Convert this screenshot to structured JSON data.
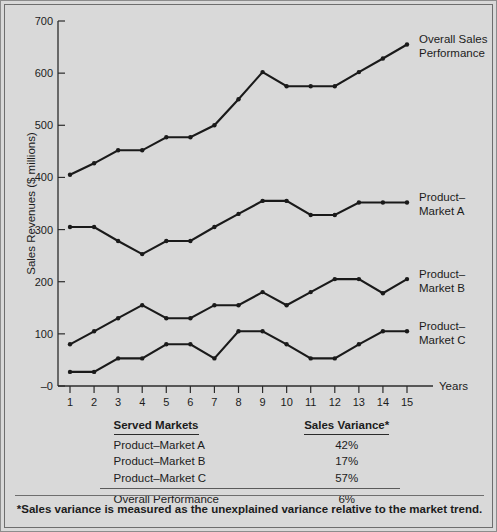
{
  "chart_data": {
    "type": "line",
    "title": "",
    "xlabel": "Years",
    "ylabel": "Sales Revenues ($ millions)",
    "x": [
      1,
      2,
      3,
      4,
      5,
      6,
      7,
      8,
      9,
      10,
      11,
      12,
      13,
      14,
      15
    ],
    "xtick_labels": [
      "1",
      "2",
      "3",
      "4",
      "5",
      "6",
      "7",
      "8",
      "9",
      "10",
      "11",
      "12",
      "13",
      "14",
      "15"
    ],
    "ytick_labels": [
      "–0",
      "100",
      "200",
      "300",
      "400",
      "500",
      "600",
      "700"
    ],
    "ytick_values": [
      0,
      100,
      200,
      300,
      400,
      500,
      600,
      700
    ],
    "ylim": [
      0,
      700
    ],
    "xlim": [
      0.5,
      15.8
    ],
    "grid": false,
    "legend_position": "right-inline",
    "line_color": "#1a1a1a",
    "marker": "circle",
    "series": [
      {
        "name": "Overall Sales Performance",
        "label_line1": "Overall Sales",
        "label_line2": "Performance",
        "values": [
          405,
          427,
          452,
          452,
          477,
          477,
          500,
          550,
          602,
          575,
          575,
          575,
          602,
          628,
          655
        ]
      },
      {
        "name": "Product–Market A",
        "label_line1": "Product–",
        "label_line2": "Market A",
        "values": [
          305,
          305,
          278,
          253,
          278,
          278,
          305,
          330,
          355,
          355,
          328,
          328,
          352,
          352,
          352
        ]
      },
      {
        "name": "Product–Market B",
        "label_line1": "Product–",
        "label_line2": "Market B",
        "values": [
          80,
          105,
          130,
          155,
          130,
          130,
          155,
          155,
          180,
          155,
          180,
          205,
          205,
          178,
          205
        ]
      },
      {
        "name": "Product–Market C",
        "label_line1": "Product–",
        "label_line2": "Market C",
        "values": [
          27,
          27,
          53,
          53,
          80,
          80,
          53,
          105,
          105,
          80,
          53,
          53,
          80,
          105,
          105
        ]
      }
    ]
  },
  "table": {
    "headers": {
      "markets": "Served Markets",
      "variance": "Sales Variance*"
    },
    "rows": [
      {
        "market": "Product–Market A",
        "variance": "42%"
      },
      {
        "market": "Product–Market B",
        "variance": "17%"
      },
      {
        "market": "Product–Market C",
        "variance": "57%"
      }
    ],
    "total": {
      "market": "Overall Performance",
      "variance": "6%"
    }
  },
  "footnote": "*Sales variance is measured as the unexplained variance relative to the market trend."
}
